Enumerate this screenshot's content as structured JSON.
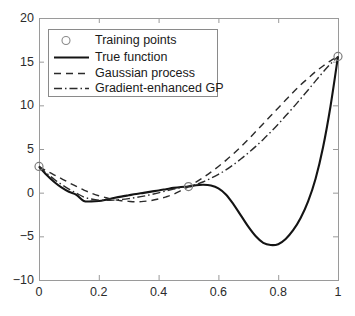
{
  "chart_data": {
    "type": "line",
    "title": "",
    "xlabel": "",
    "ylabel": "",
    "xlim": [
      0,
      1
    ],
    "ylim": [
      -10,
      20
    ],
    "grid": false,
    "legend_position": "upper left",
    "xticks": [
      "0",
      "0.2",
      "0.4",
      "0.6",
      "0.8",
      "1"
    ],
    "xtick_values": [
      0,
      0.2,
      0.4,
      0.6,
      0.8,
      1
    ],
    "yticks": [
      "20",
      "15",
      "10",
      "5",
      "0",
      "-5",
      "-10"
    ],
    "ytick_values": [
      20,
      15,
      10,
      5,
      0,
      -5,
      -10
    ],
    "legend": [
      {
        "label": "Training points",
        "style": "marker-circle"
      },
      {
        "label": "True function",
        "style": "solid"
      },
      {
        "label": "Gaussian process",
        "style": "dashed"
      },
      {
        "label": "Gradient-enhanced GP",
        "style": "dashdot"
      }
    ],
    "series": [
      {
        "name": "Training points",
        "style": "marker-circle",
        "x": [
          0.0,
          0.5,
          1.0
        ],
        "values": [
          3.0,
          0.7,
          15.6
        ]
      },
      {
        "name": "True function",
        "style": "solid",
        "x": [
          0.0,
          0.025,
          0.05,
          0.075,
          0.1,
          0.125,
          0.15,
          0.175,
          0.2,
          0.225,
          0.25,
          0.275,
          0.3,
          0.325,
          0.35,
          0.375,
          0.4,
          0.425,
          0.45,
          0.475,
          0.5,
          0.525,
          0.55,
          0.575,
          0.6,
          0.625,
          0.65,
          0.675,
          0.7,
          0.725,
          0.75,
          0.775,
          0.8,
          0.825,
          0.85,
          0.875,
          0.9,
          0.925,
          0.95,
          0.975,
          1.0
        ],
        "values": [
          3.0,
          2.05,
          1.25,
          0.6,
          0.1,
          -0.25,
          -0.95,
          -1.0,
          -0.95,
          -0.8,
          -0.62,
          -0.45,
          -0.3,
          -0.15,
          -0.02,
          0.12,
          0.25,
          0.4,
          0.55,
          0.65,
          0.7,
          0.85,
          0.9,
          0.82,
          0.5,
          -0.2,
          -1.3,
          -2.6,
          -3.9,
          -5.0,
          -5.75,
          -6.0,
          -5.9,
          -5.3,
          -4.3,
          -2.9,
          -1.0,
          1.6,
          5.2,
          9.9,
          15.6
        ]
      },
      {
        "name": "Gaussian process",
        "style": "dashed",
        "x": [
          0.0,
          0.025,
          0.05,
          0.075,
          0.1,
          0.125,
          0.15,
          0.175,
          0.2,
          0.225,
          0.25,
          0.275,
          0.3,
          0.325,
          0.35,
          0.375,
          0.4,
          0.425,
          0.45,
          0.475,
          0.5,
          0.525,
          0.55,
          0.575,
          0.6,
          0.625,
          0.65,
          0.675,
          0.7,
          0.725,
          0.75,
          0.775,
          0.8,
          0.825,
          0.85,
          0.875,
          0.9,
          0.925,
          0.95,
          0.975,
          1.0
        ],
        "values": [
          3.0,
          2.5,
          2.05,
          1.6,
          1.15,
          0.72,
          0.3,
          -0.05,
          -0.35,
          -0.58,
          -0.78,
          -0.92,
          -1.0,
          -1.05,
          -1.0,
          -0.9,
          -0.72,
          -0.48,
          -0.18,
          0.25,
          0.7,
          1.2,
          1.75,
          2.35,
          3.0,
          3.7,
          4.45,
          5.25,
          6.1,
          7.0,
          7.9,
          8.8,
          9.7,
          10.6,
          11.5,
          12.35,
          13.1,
          13.85,
          14.5,
          15.1,
          15.6
        ]
      },
      {
        "name": "Gradient-enhanced GP",
        "style": "dashdot",
        "x": [
          0.0,
          0.025,
          0.05,
          0.075,
          0.1,
          0.125,
          0.15,
          0.175,
          0.2,
          0.225,
          0.25,
          0.275,
          0.3,
          0.325,
          0.35,
          0.375,
          0.4,
          0.425,
          0.45,
          0.475,
          0.5,
          0.525,
          0.55,
          0.575,
          0.6,
          0.625,
          0.65,
          0.675,
          0.7,
          0.725,
          0.75,
          0.775,
          0.8,
          0.825,
          0.85,
          0.875,
          0.9,
          0.925,
          0.95,
          0.975,
          1.0
        ],
        "values": [
          3.0,
          2.25,
          1.55,
          0.95,
          0.4,
          -0.05,
          -0.5,
          -0.72,
          -0.85,
          -0.88,
          -0.85,
          -0.78,
          -0.68,
          -0.55,
          -0.4,
          -0.22,
          -0.02,
          0.2,
          0.4,
          0.58,
          0.72,
          0.95,
          1.25,
          1.65,
          2.1,
          2.6,
          3.2,
          3.85,
          4.55,
          5.3,
          6.1,
          6.95,
          7.85,
          8.8,
          9.75,
          10.75,
          11.75,
          12.8,
          13.8,
          14.75,
          15.6
        ]
      }
    ]
  },
  "axes": {
    "plot_area": {
      "left": 39,
      "top": 18,
      "right": 338,
      "bottom": 280
    }
  }
}
